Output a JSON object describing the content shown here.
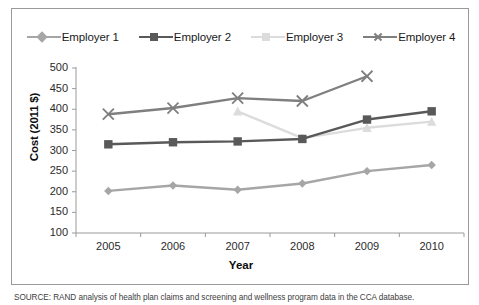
{
  "figure": {
    "source_note": "SOURCE: RAND analysis of health plan claims and screening and wellness program data in the CCA database."
  },
  "colors": {
    "employer1": "#a6a6a6",
    "employer2": "#595959",
    "employer3": "#dcdcdc",
    "employer4": "#7f7f7f",
    "axis": "#9a9a9a",
    "text": "#1a1a1a",
    "frame_border": "#9a9a9a"
  },
  "legend": {
    "position": "top",
    "items": [
      {
        "label": "Employer 1",
        "marker": "diamond-marker",
        "color": "#a6a6a6"
      },
      {
        "label": "Employer 2",
        "marker": "square-marker",
        "color": "#595959"
      },
      {
        "label": "Employer 3",
        "marker": "triangle-marker",
        "color": "#dcdcdc"
      },
      {
        "label": "Employer 4",
        "marker": "x-marker",
        "color": "#7f7f7f"
      }
    ]
  },
  "axes": {
    "y_title": "Cost (2011 $)",
    "x_title": "Year",
    "y_ticks": [
      "500",
      "450",
      "400",
      "350",
      "300",
      "250",
      "200",
      "150",
      "100"
    ],
    "x_ticks": [
      "2005",
      "2006",
      "2007",
      "2008",
      "2009",
      "2010"
    ]
  },
  "chart_data": {
    "type": "line",
    "title": "",
    "xlabel": "Year",
    "ylabel": "Cost (2011 $)",
    "categories": [
      "2005",
      "2006",
      "2007",
      "2008",
      "2009",
      "2010"
    ],
    "x": [
      2005,
      2006,
      2007,
      2008,
      2009,
      2010
    ],
    "ylim": [
      100,
      500
    ],
    "yticks": [
      100,
      150,
      200,
      250,
      300,
      350,
      400,
      450,
      500
    ],
    "grid": false,
    "legend_position": "top",
    "series": [
      {
        "name": "Employer 1",
        "color": "#a6a6a6",
        "marker": "diamond",
        "values": [
          202,
          215,
          205,
          220,
          250,
          265
        ]
      },
      {
        "name": "Employer 2",
        "color": "#595959",
        "marker": "square",
        "values": [
          315,
          320,
          322,
          328,
          375,
          395
        ]
      },
      {
        "name": "Employer 3",
        "color": "#dcdcdc",
        "marker": "triangle",
        "values": [
          null,
          null,
          395,
          330,
          355,
          370
        ]
      },
      {
        "name": "Employer 4",
        "color": "#7f7f7f",
        "marker": "x",
        "values": [
          388,
          403,
          427,
          420,
          480,
          null
        ]
      }
    ]
  }
}
